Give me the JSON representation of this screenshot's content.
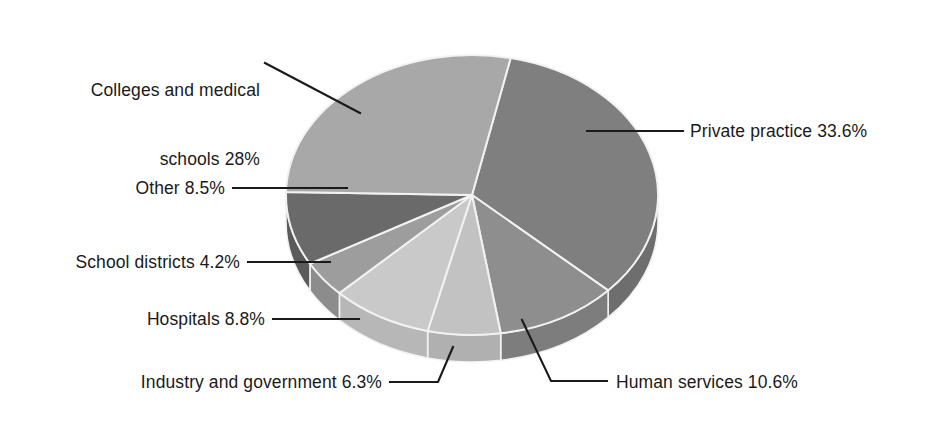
{
  "chart_data": {
    "type": "pie",
    "title": "",
    "subtitle": "",
    "xlabel": "",
    "ylabel": "",
    "legend_position": "callout-labels",
    "grid": false,
    "style": "3d-exploded-none",
    "units": "percent",
    "categories": [
      "Private practice",
      "Human services",
      "Industry and government",
      "Hospitals",
      "School districts",
      "Other",
      "Colleges and medical schools"
    ],
    "values": [
      33.6,
      10.6,
      6.3,
      8.8,
      4.2,
      8.5,
      28.0
    ],
    "slices": [
      {
        "name": "private-practice",
        "label": "Private practice 33.6%",
        "category": "Private practice",
        "value": 33.6,
        "color": "#7f7f7f",
        "side_color": "#6e6e6e"
      },
      {
        "name": "human-services",
        "label": "Human services 10.6%",
        "category": "Human services",
        "value": 10.6,
        "color": "#8e8e8e",
        "side_color": "#7d7d7d"
      },
      {
        "name": "industry-and-government",
        "label": "Industry and government 6.3%",
        "category": "Industry and government",
        "value": 6.3,
        "color": "#c2c2c2",
        "side_color": "#b0b0b0"
      },
      {
        "name": "hospitals",
        "label": "Hospitals 8.8%",
        "category": "Hospitals",
        "value": 8.8,
        "color": "#c9c9c9",
        "side_color": "#b7b7b7"
      },
      {
        "name": "school-districts",
        "label": "School districts 4.2%",
        "category": "School districts",
        "value": 4.2,
        "color": "#9d9d9d",
        "side_color": "#8c8c8c"
      },
      {
        "name": "other",
        "label": "Other 8.5%",
        "category": "Other",
        "value": 8.5,
        "color": "#6a6a6a",
        "side_color": "#5b5b5b"
      },
      {
        "name": "colleges-and-medical-schools",
        "label": "Colleges and medical schools 28%",
        "category": "Colleges and medical schools",
        "value": 28.0,
        "color": "#a8a8a8",
        "side_color": "#979797"
      }
    ]
  },
  "labels": {
    "colleges_line1": "Colleges and medical",
    "colleges_line2": "schools 28%",
    "private_practice": "Private practice 33.6%",
    "other": "Other 8.5%",
    "school_districts": "School districts 4.2%",
    "hospitals": "Hospitals 8.8%",
    "industry_and_government": "Industry and government 6.3%",
    "human_services": "Human services 10.6%"
  },
  "colors": {
    "background": "#ffffff",
    "text": "#1a1a1a",
    "leader_line": "#1a1a1a",
    "slice_separator": "#f2f2f2",
    "shadow": "#d9d9d9"
  }
}
